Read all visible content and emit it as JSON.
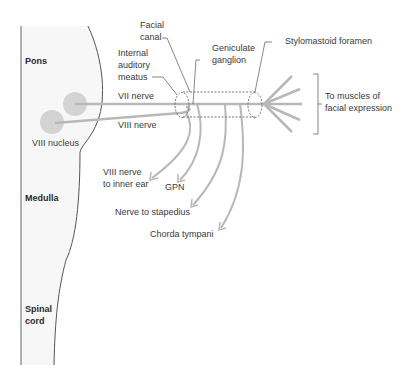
{
  "regions": {
    "pons": "Pons",
    "medulla": "Medulla",
    "spinal_cord_line1": "Spinal",
    "spinal_cord_line2": "cord"
  },
  "labels": {
    "facial_canal_1": "Facial",
    "facial_canal_2": "canal",
    "internal_auditory_1": "Internal",
    "internal_auditory_2": "auditory",
    "internal_auditory_3": "meatus",
    "geniculate_1": "Geniculate",
    "geniculate_2": "ganglion",
    "stylomastoid": "Stylomastoid foramen",
    "vii_nerve": "VII nerve",
    "viii_nerve": "VIII nerve",
    "viii_nucleus": "VIII nucleus",
    "viii_inner_ear_1": "VIII nerve",
    "viii_inner_ear_2": "to inner ear",
    "gpn": "GPN",
    "stapedius": "Nerve to stapedius",
    "chorda": "Chorda tympani",
    "muscles_1": "To muscles of",
    "muscles_2": "facial expression"
  },
  "colors": {
    "nerve": "#b8b8b8",
    "nucleus": "#d3d3d3",
    "outline": "#555555",
    "text": "#3a3a3a",
    "brainstem_fill": "#f7f7f7"
  }
}
